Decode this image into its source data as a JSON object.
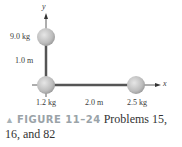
{
  "figure": {
    "axes": {
      "x_label": "x",
      "y_label": "y"
    },
    "masses": [
      {
        "label": "9.0 kg",
        "position": "(0, 1.0 m)"
      },
      {
        "label": "1.2 kg",
        "position": "origin"
      },
      {
        "label": "2.5 kg",
        "position": "(2.0 m, 0)"
      }
    ],
    "distances": {
      "vertical": "1.0 m",
      "horizontal": "2.0 m"
    },
    "colors": {
      "sphere": "#c4c4c4",
      "rod": "#555555",
      "axis": "#333333",
      "figure_label": "#9aa3a8"
    }
  },
  "caption": {
    "marker": "▲",
    "figure_id": "FIGURE 11–24",
    "line1_text": "Problems 15,",
    "line2_text": "16, and 82"
  }
}
